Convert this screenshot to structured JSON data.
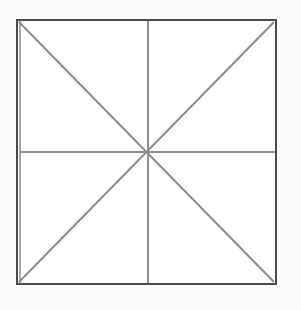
{
  "diagram": {
    "type": "square-with-diagonals-and-midlines",
    "canvas": {
      "width": 301,
      "height": 310,
      "background": "#fbfbfb"
    },
    "square": {
      "x0": 17,
      "y0": 20,
      "x1": 276,
      "y1": 284,
      "fill": "#ffffff",
      "outer_stroke": "#4a4a4a",
      "outer_stroke_width": 2,
      "inner_stroke": "#8a8a8a",
      "inner_offset": 3
    },
    "center": {
      "x": 148,
      "y": 152
    },
    "lines": [
      {
        "name": "diagonal-tl-br",
        "x1": 19,
        "y1": 22,
        "x2": 274,
        "y2": 282
      },
      {
        "name": "diagonal-tr-bl",
        "x1": 274,
        "y1": 22,
        "x2": 19,
        "y2": 282
      },
      {
        "name": "vertical-midline",
        "x1": 148,
        "y1": 21,
        "x2": 148,
        "y2": 283
      },
      {
        "name": "horizontal-midline",
        "x1": 20,
        "y1": 152,
        "x2": 275,
        "y2": 152
      }
    ],
    "line_color": "#8c8c8c",
    "line_width": 2
  }
}
